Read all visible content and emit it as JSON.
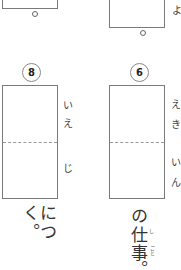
{
  "top_row": {
    "left_box": {
      "period_mark": "。"
    },
    "right_box": {
      "period_mark": "。",
      "side_kana": "よ"
    }
  },
  "questions": [
    {
      "number": "8",
      "side_kana_top": [
        "い",
        "え"
      ],
      "side_kana_bottom": [
        "じ"
      ],
      "after_text": "につく。"
    },
    {
      "number": "6",
      "side_kana_top": [
        "え",
        "き"
      ],
      "side_kana_bottom": [
        "い",
        "ん"
      ],
      "after_text_parts": [
        "の",
        "仕",
        "事",
        "。"
      ],
      "furigana": [
        "し",
        "ごと"
      ]
    }
  ]
}
